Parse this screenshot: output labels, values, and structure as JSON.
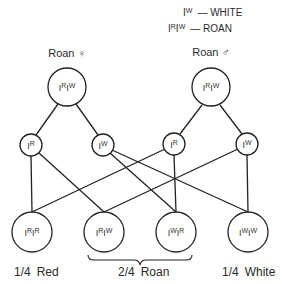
{
  "legend": {
    "items": [
      {
        "allele": "I",
        "sup": "W",
        "text": "— WHITE"
      },
      {
        "allele": "I",
        "sup": "R",
        "allele2": "I",
        "sup2": "W",
        "text": "— ROAN"
      }
    ]
  },
  "parents": {
    "female": {
      "label": "Roan ♀",
      "genotype_sup1": "R",
      "genotype_sup2": "W"
    },
    "male": {
      "label": "Roan ♂",
      "genotype_sup1": "R",
      "genotype_sup2": "W"
    }
  },
  "gametes": [
    {
      "id": "fR",
      "sup": "R"
    },
    {
      "id": "fW",
      "sup": "W"
    },
    {
      "id": "mR",
      "sup": "R"
    },
    {
      "id": "mW",
      "sup": "W"
    }
  ],
  "offspring": [
    {
      "sup1": "R",
      "sup2": "R"
    },
    {
      "sup1": "R",
      "sup2": "W"
    },
    {
      "sup1": "W",
      "sup2": "R"
    },
    {
      "sup1": "W",
      "sup2": "W"
    }
  ],
  "ratios": {
    "red": {
      "fraction": "1/4",
      "label": "Red"
    },
    "roan": {
      "fraction": "2/4",
      "label": "Roan"
    },
    "white": {
      "fraction": "1/4",
      "label": "White"
    }
  }
}
